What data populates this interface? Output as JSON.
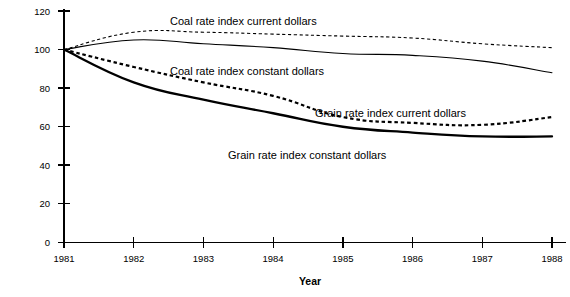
{
  "chart_data": {
    "type": "line",
    "title": "",
    "subtitle": "",
    "xlabel": "Year",
    "ylabel": "",
    "x": [
      1981,
      1982,
      1983,
      1984,
      1985,
      1986,
      1987,
      1988
    ],
    "categories": [
      "1981",
      "1982",
      "1983",
      "1984",
      "1985",
      "1986",
      "1987",
      "1988"
    ],
    "xlim": [
      1981,
      1988
    ],
    "ylim": [
      0,
      120
    ],
    "ytick_labels": [
      "0",
      "20",
      "40",
      "60",
      "80",
      "100",
      "120"
    ],
    "ytick_values": [
      0,
      20,
      40,
      60,
      80,
      100,
      120
    ],
    "xtick_labels": [
      "1981",
      "1982",
      "1983",
      "1984",
      "1985",
      "1986",
      "1987",
      "1988"
    ],
    "grid": false,
    "legend_position": "inline-annotations",
    "series": [
      {
        "name": "Coal rate index current dollars",
        "style": "dashed-thin",
        "values": [
          100,
          109,
          109,
          108,
          107,
          106,
          103,
          101
        ]
      },
      {
        "name": "Coal rate index constant dollars",
        "style": "solid-thin",
        "values": [
          100,
          105,
          103,
          101,
          98,
          97,
          94,
          88
        ]
      },
      {
        "name": "Grain rate index current dollars",
        "style": "dashed-thick",
        "values": [
          100,
          91,
          83,
          76,
          65,
          62,
          61,
          65
        ]
      },
      {
        "name": "Grain rate index constant dollars",
        "style": "solid-thick",
        "values": [
          100,
          83,
          74,
          67,
          60,
          57,
          55,
          55
        ]
      }
    ],
    "annotations": [
      {
        "text": "Coal rate index current dollars",
        "x_px": 170,
        "y_px": 25
      },
      {
        "text": "Coal rate index constant dollars",
        "x_px": 170,
        "y_px": 75
      },
      {
        "text": "Grain rate index current dollars",
        "x_px": 315,
        "y_px": 117
      },
      {
        "text": "Grain rate index constant dollars",
        "x_px": 228,
        "y_px": 159
      }
    ]
  },
  "axis": {
    "x_title": "Year",
    "y_ticks": [
      "120",
      "100",
      "80",
      "60",
      "40",
      "20",
      "0"
    ],
    "x_ticks": [
      "1981",
      "1982",
      "1983",
      "1984",
      "1985",
      "1986",
      "1987",
      "1988"
    ]
  },
  "labels": {
    "coal_current": "Coal rate index current dollars",
    "coal_constant": "Coal rate index constant dollars",
    "grain_current": "Grain rate index current dollars",
    "grain_constant": "Grain rate index constant dollars"
  },
  "colors": {
    "ink": "#000000",
    "background": "#ffffff"
  }
}
